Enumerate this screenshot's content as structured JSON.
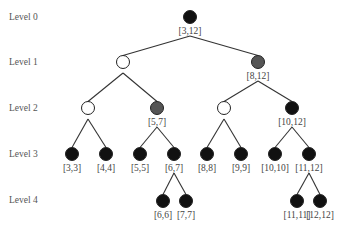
{
  "levels": [
    "Level 0",
    "Level 1",
    "Level 2",
    "Level 3",
    "Level 4"
  ],
  "colors": {
    "black": "#111111",
    "gray": "#555555",
    "open": "#ffffff",
    "edge": "#333333"
  },
  "nodes": [
    {
      "id": "n0",
      "x": 190,
      "y": 17,
      "fill": "black",
      "label": "[3,12]",
      "parent": null
    },
    {
      "id": "n1",
      "x": 123,
      "y": 62,
      "fill": "open",
      "label": "",
      "parent": "n0"
    },
    {
      "id": "n2",
      "x": 258,
      "y": 62,
      "fill": "gray",
      "label": "[8,12]",
      "parent": "n0"
    },
    {
      "id": "n3",
      "x": 88,
      "y": 108,
      "fill": "open",
      "label": "",
      "parent": "n1"
    },
    {
      "id": "n4",
      "x": 157,
      "y": 108,
      "fill": "gray",
      "label": "[5,7]",
      "parent": "n1"
    },
    {
      "id": "n5",
      "x": 224,
      "y": 108,
      "fill": "open",
      "label": "",
      "parent": "n2"
    },
    {
      "id": "n6",
      "x": 292,
      "y": 108,
      "fill": "black",
      "label": "[10,12]",
      "parent": "n2"
    },
    {
      "id": "n7",
      "x": 72,
      "y": 154,
      "fill": "black",
      "label": "[3,3]",
      "parent": "n3"
    },
    {
      "id": "n8",
      "x": 106,
      "y": 154,
      "fill": "black",
      "label": "[4,4]",
      "parent": "n3"
    },
    {
      "id": "n9",
      "x": 140,
      "y": 154,
      "fill": "black",
      "label": "[5,5]",
      "parent": "n4"
    },
    {
      "id": "n10",
      "x": 174,
      "y": 154,
      "fill": "black",
      "label": "[6,7]",
      "parent": "n4"
    },
    {
      "id": "n11",
      "x": 207,
      "y": 154,
      "fill": "black",
      "label": "[8,8]",
      "parent": "n5"
    },
    {
      "id": "n12",
      "x": 241,
      "y": 154,
      "fill": "black",
      "label": "[9,9]",
      "parent": "n5"
    },
    {
      "id": "n13",
      "x": 275,
      "y": 154,
      "fill": "black",
      "label": "[10,10]",
      "parent": "n6"
    },
    {
      "id": "n14",
      "x": 309,
      "y": 154,
      "fill": "black",
      "label": "[11,12]",
      "parent": "n6"
    },
    {
      "id": "n15",
      "x": 163,
      "y": 201,
      "fill": "black",
      "label": "[6,6]",
      "parent": "n10"
    },
    {
      "id": "n16",
      "x": 186,
      "y": 201,
      "fill": "black",
      "label": "[7,7]",
      "parent": "n10"
    },
    {
      "id": "n17",
      "x": 297,
      "y": 201,
      "fill": "black",
      "label": "[11,11]",
      "parent": "n14"
    },
    {
      "id": "n18",
      "x": 320,
      "y": 201,
      "fill": "black",
      "label": "[12,12]",
      "parent": "n14"
    }
  ]
}
